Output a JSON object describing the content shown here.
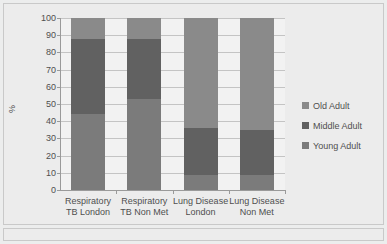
{
  "chart_data": {
    "type": "bar",
    "subtype": "stacked-100-percent",
    "title": "",
    "xlabel": "",
    "ylabel": "%",
    "ylim": [
      0,
      100
    ],
    "ytick_step": 10,
    "yticks": [
      100,
      90,
      80,
      70,
      60,
      50,
      40,
      30,
      20,
      10,
      0
    ],
    "grid": true,
    "legend_position": "right",
    "categories": [
      "Respiratory TB London",
      "Respiratory TB Non Met",
      "Lung Disease London",
      "Lung Disease Non Met"
    ],
    "category_lines": [
      [
        "Respiratory",
        "TB London"
      ],
      [
        "Respiratory",
        "TB Non Met"
      ],
      [
        "Lung Disease",
        "London"
      ],
      [
        "Lung Disease",
        "Non Met"
      ]
    ],
    "series": [
      {
        "name": "Young Adult",
        "values": [
          44,
          53,
          9,
          9
        ],
        "color": "#7b7b7b"
      },
      {
        "name": "Middle Adult",
        "values": [
          44,
          35,
          27,
          26
        ],
        "color": "#616161"
      },
      {
        "name": "Old Adult",
        "values": [
          12,
          12,
          64,
          65
        ],
        "color": "#8a8a8a"
      }
    ],
    "stack_boundaries": {
      "young_top": [
        44,
        53,
        9,
        9
      ],
      "middle_top": [
        88,
        88,
        36,
        35
      ]
    }
  },
  "legend": {
    "items": [
      {
        "label": "Old Adult",
        "color": "#8a8a8a"
      },
      {
        "label": "Middle Adult",
        "color": "#616161"
      },
      {
        "label": "Young Adult",
        "color": "#7b7b7b"
      }
    ]
  },
  "colors": {
    "plot_background": "#f2f2f2",
    "chart_background": "#ececec",
    "gridline": "#c4c4c4",
    "axis": "#9a9a9a",
    "text": "#4f4f4f"
  }
}
